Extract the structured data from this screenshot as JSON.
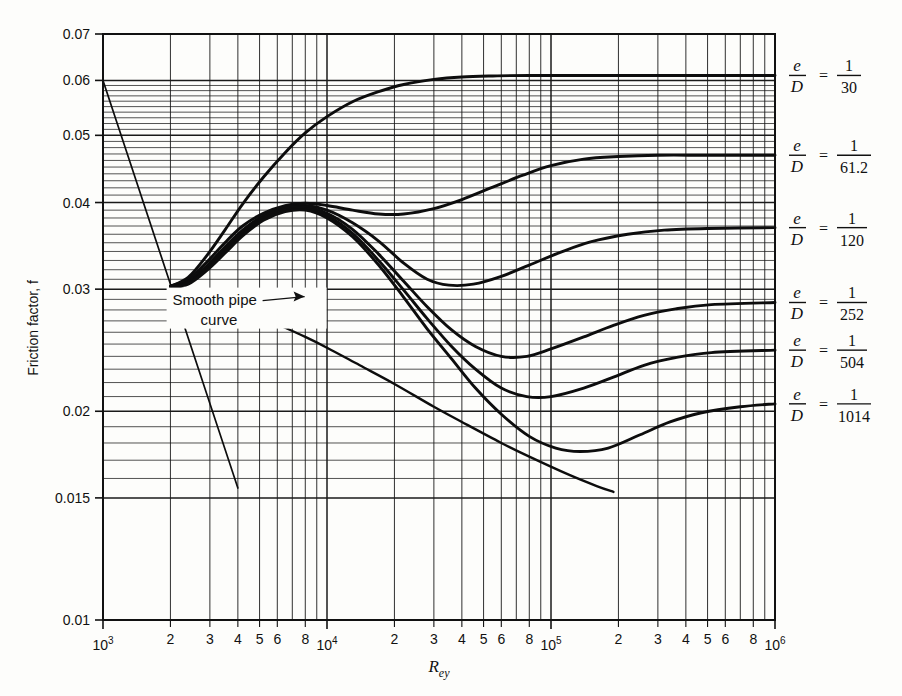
{
  "chart_data": {
    "type": "line",
    "title": "",
    "xlabel": "Rey",
    "ylabel": "Friction factor, f",
    "xscale": "log",
    "yscale": "log",
    "xlim": [
      1000,
      1000000
    ],
    "ylim": [
      0.01,
      0.07
    ],
    "grid": true,
    "legend_position": "right",
    "x_tick_labels": [
      "10³",
      "2",
      "3",
      "4",
      "5",
      "6",
      "8",
      "10⁴",
      "2",
      "3",
      "4",
      "5",
      "6",
      "8",
      "10⁵",
      "2",
      "3",
      "4",
      "5",
      "6",
      "8",
      "10⁶"
    ],
    "x_tick_values": [
      1000,
      2000,
      3000,
      4000,
      5000,
      6000,
      8000,
      10000,
      20000,
      30000,
      40000,
      50000,
      60000,
      80000,
      100000,
      200000,
      300000,
      400000,
      500000,
      600000,
      800000,
      1000000
    ],
    "y_tick_labels": [
      "0.07",
      "0.06",
      "0.05",
      "0.04",
      "0.03",
      "0.02",
      "0.015",
      "0.01"
    ],
    "y_tick_values": [
      0.07,
      0.06,
      0.05,
      0.04,
      0.03,
      0.02,
      0.015,
      0.01
    ],
    "annotations": [
      {
        "text_line1": "Smooth pipe",
        "text_line2": "curve",
        "x": 4200,
        "y": 0.0285
      }
    ],
    "series": [
      {
        "name": "laminar",
        "label": "",
        "points": [
          [
            1000,
            0.06
          ],
          [
            4000,
            0.0155
          ]
        ]
      },
      {
        "name": "smooth-pipe",
        "label": "Smooth pipe curve",
        "points": [
          [
            2000,
            0.0303
          ],
          [
            2300,
            0.03
          ],
          [
            2800,
            0.0294
          ],
          [
            3500,
            0.0287
          ],
          [
            4500,
            0.0278
          ],
          [
            6000,
            0.0267
          ],
          [
            8000,
            0.0256
          ],
          [
            10000,
            0.0247
          ],
          [
            14000,
            0.0233
          ],
          [
            20000,
            0.0219
          ],
          [
            30000,
            0.0203
          ],
          [
            40000,
            0.0193
          ],
          [
            60000,
            0.018
          ],
          [
            80000,
            0.0172
          ],
          [
            120000,
            0.0162
          ],
          [
            160000,
            0.0156
          ],
          [
            190000,
            0.0153
          ]
        ]
      },
      {
        "name": "eD-1-30",
        "label": "1/30",
        "points": [
          [
            2000,
            0.0303
          ],
          [
            2400,
            0.0312
          ],
          [
            2900,
            0.0335
          ],
          [
            3500,
            0.0365
          ],
          [
            4200,
            0.0398
          ],
          [
            5200,
            0.0435
          ],
          [
            6500,
            0.0472
          ],
          [
            8000,
            0.0504
          ],
          [
            10000,
            0.0532
          ],
          [
            13000,
            0.0559
          ],
          [
            17000,
            0.0578
          ],
          [
            22000,
            0.0592
          ],
          [
            30000,
            0.0602
          ],
          [
            40000,
            0.0607
          ],
          [
            55000,
            0.0609
          ],
          [
            80000,
            0.061
          ],
          [
            200000,
            0.061
          ],
          [
            1000000,
            0.061
          ]
        ]
      },
      {
        "name": "eD-1-61-2",
        "label": "1/61.2",
        "points": [
          [
            2000,
            0.0303
          ],
          [
            2400,
            0.031
          ],
          [
            2900,
            0.0328
          ],
          [
            3500,
            0.035
          ],
          [
            4200,
            0.037
          ],
          [
            5200,
            0.0386
          ],
          [
            6500,
            0.0396
          ],
          [
            8000,
            0.0399
          ],
          [
            10000,
            0.0396
          ],
          [
            13000,
            0.039
          ],
          [
            17000,
            0.0385
          ],
          [
            22000,
            0.0385
          ],
          [
            30000,
            0.0392
          ],
          [
            40000,
            0.0404
          ],
          [
            55000,
            0.0421
          ],
          [
            75000,
            0.0438
          ],
          [
            100000,
            0.0452
          ],
          [
            140000,
            0.0462
          ],
          [
            200000,
            0.0466
          ],
          [
            300000,
            0.0468
          ],
          [
            500000,
            0.0468
          ],
          [
            1000000,
            0.0468
          ]
        ]
      },
      {
        "name": "eD-1-120",
        "label": "1/120",
        "points": [
          [
            2000,
            0.0303
          ],
          [
            2400,
            0.0308
          ],
          [
            2900,
            0.0324
          ],
          [
            3500,
            0.0345
          ],
          [
            4200,
            0.0365
          ],
          [
            5200,
            0.0383
          ],
          [
            6500,
            0.0394
          ],
          [
            8000,
            0.0396
          ],
          [
            10000,
            0.039
          ],
          [
            13000,
            0.0374
          ],
          [
            17000,
            0.0352
          ],
          [
            22000,
            0.0327
          ],
          [
            28000,
            0.031
          ],
          [
            35000,
            0.0304
          ],
          [
            45000,
            0.0305
          ],
          [
            60000,
            0.0313
          ],
          [
            80000,
            0.0325
          ],
          [
            110000,
            0.0339
          ],
          [
            150000,
            0.0351
          ],
          [
            220000,
            0.036
          ],
          [
            320000,
            0.0365
          ],
          [
            500000,
            0.0367
          ],
          [
            1000000,
            0.0368
          ]
        ]
      },
      {
        "name": "eD-1-252",
        "label": "1/252",
        "points": [
          [
            2000,
            0.0303
          ],
          [
            2400,
            0.0307
          ],
          [
            2900,
            0.0322
          ],
          [
            3500,
            0.0342
          ],
          [
            4200,
            0.0362
          ],
          [
            5200,
            0.0381
          ],
          [
            6500,
            0.0392
          ],
          [
            8000,
            0.0394
          ],
          [
            10000,
            0.0386
          ],
          [
            13000,
            0.0366
          ],
          [
            17000,
            0.0337
          ],
          [
            22000,
            0.0308
          ],
          [
            28000,
            0.0283
          ],
          [
            36000,
            0.0262
          ],
          [
            46000,
            0.0248
          ],
          [
            60000,
            0.024
          ],
          [
            78000,
            0.024
          ],
          [
            100000,
            0.0246
          ],
          [
            140000,
            0.0256
          ],
          [
            190000,
            0.0266
          ],
          [
            260000,
            0.0275
          ],
          [
            360000,
            0.0281
          ],
          [
            520000,
            0.0285
          ],
          [
            1000000,
            0.0287
          ]
        ]
      },
      {
        "name": "eD-1-504",
        "label": "1/504",
        "points": [
          [
            2000,
            0.0303
          ],
          [
            2400,
            0.0306
          ],
          [
            2900,
            0.032
          ],
          [
            3500,
            0.034
          ],
          [
            4200,
            0.036
          ],
          [
            5200,
            0.0379
          ],
          [
            6500,
            0.039
          ],
          [
            8000,
            0.0392
          ],
          [
            10000,
            0.0383
          ],
          [
            13000,
            0.0361
          ],
          [
            17000,
            0.033
          ],
          [
            22000,
            0.0299
          ],
          [
            28000,
            0.0272
          ],
          [
            36000,
            0.0248
          ],
          [
            46000,
            0.023
          ],
          [
            60000,
            0.0216
          ],
          [
            78000,
            0.021
          ],
          [
            100000,
            0.021
          ],
          [
            140000,
            0.0216
          ],
          [
            190000,
            0.0224
          ],
          [
            260000,
            0.0233
          ],
          [
            360000,
            0.0239
          ],
          [
            520000,
            0.0243
          ],
          [
            1000000,
            0.0245
          ]
        ]
      },
      {
        "name": "eD-1-1014",
        "label": "1/1014",
        "points": [
          [
            2000,
            0.0303
          ],
          [
            2400,
            0.0305
          ],
          [
            2900,
            0.0319
          ],
          [
            3500,
            0.0338
          ],
          [
            4200,
            0.0358
          ],
          [
            5200,
            0.0377
          ],
          [
            6500,
            0.0388
          ],
          [
            8000,
            0.039
          ],
          [
            10000,
            0.038
          ],
          [
            13000,
            0.0357
          ],
          [
            17000,
            0.0325
          ],
          [
            22000,
            0.0292
          ],
          [
            28000,
            0.0263
          ],
          [
            36000,
            0.0238
          ],
          [
            46000,
            0.0216
          ],
          [
            60000,
            0.0198
          ],
          [
            80000,
            0.0184
          ],
          [
            105000,
            0.0177
          ],
          [
            135000,
            0.0175
          ],
          [
            180000,
            0.0177
          ],
          [
            250000,
            0.0185
          ],
          [
            340000,
            0.0193
          ],
          [
            470000,
            0.0199
          ],
          [
            700000,
            0.0203
          ],
          [
            1000000,
            0.0205
          ]
        ]
      }
    ],
    "legend_entries": [
      {
        "numerator": "1",
        "denominator": "30",
        "ratio_label": "e/D = 1/30",
        "y_value": 0.061,
        "anchor_y": 0.061
      },
      {
        "numerator": "1",
        "denominator": "61.2",
        "ratio_label": "e/D = 1/61.2",
        "y_value": 0.0468,
        "anchor_y": 0.0468
      },
      {
        "numerator": "1",
        "denominator": "120",
        "ratio_label": "e/D = 1/120",
        "y_value": 0.0368,
        "anchor_y": 0.0368
      },
      {
        "numerator": "1",
        "denominator": "252",
        "ratio_label": "e/D = 1/252",
        "y_value": 0.0287,
        "anchor_y": 0.0287
      },
      {
        "numerator": "1",
        "denominator": "504",
        "ratio_label": "e/D = 1/504",
        "y_value": 0.0245,
        "anchor_y": 0.0245
      },
      {
        "numerator": "1",
        "denominator": "1014",
        "ratio_label": "e/D = 1/1014",
        "y_value": 0.0205,
        "anchor_y": 0.0205
      }
    ],
    "legend_symbol": {
      "numerator_var": "e",
      "denominator_var": "D",
      "equals": "="
    }
  }
}
